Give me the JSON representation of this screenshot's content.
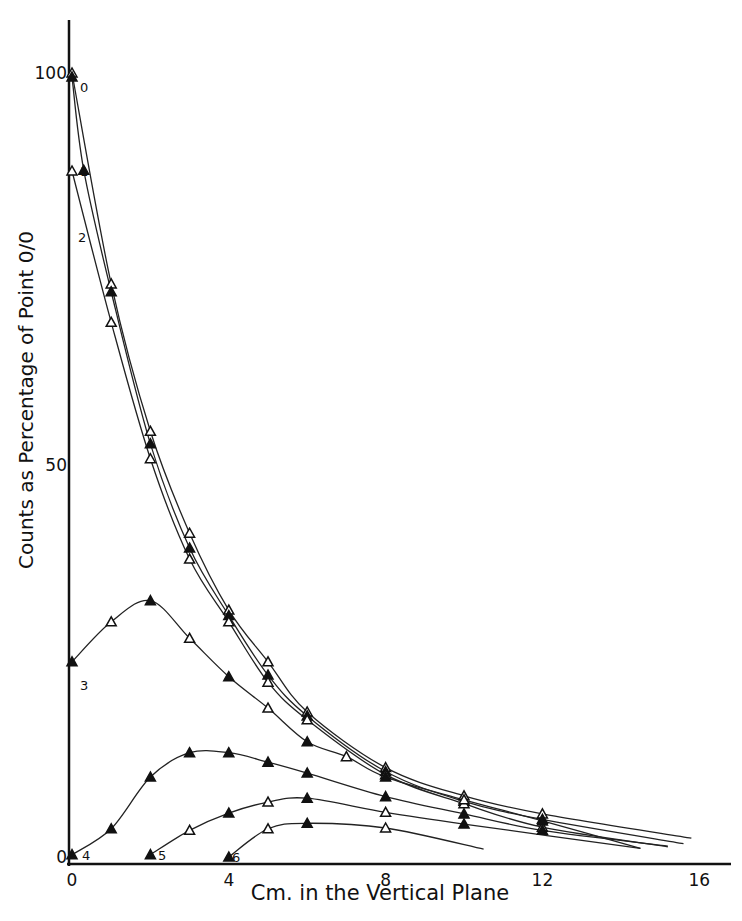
{
  "chart_data": {
    "type": "line",
    "title": "",
    "xlabel": "Cm. in the Vertical Plane",
    "ylabel": "Counts as Percentage of Point 0/0",
    "xlim": [
      0,
      17
    ],
    "ylim": [
      0,
      107
    ],
    "x_ticks": [
      0,
      4,
      8,
      12,
      16
    ],
    "x_tick_labels": [
      "0",
      "4",
      "8",
      "12",
      "16"
    ],
    "y_ticks": [
      0,
      50,
      100
    ],
    "y_tick_labels": [
      "0",
      "50",
      "100"
    ],
    "grid": false,
    "legend": "none (curves labeled inline 0-6)",
    "series": [
      {
        "name": "0",
        "marker": "open-triangle",
        "points": [
          [
            0,
            100
          ],
          [
            1,
            73.1
          ],
          [
            2,
            54.3
          ],
          [
            3,
            41.3
          ],
          [
            4,
            31.5
          ],
          [
            5,
            24.9
          ],
          [
            6,
            18.5
          ],
          [
            8,
            11.4
          ],
          [
            10,
            7.8
          ],
          [
            12,
            5.5
          ],
          [
            15.8,
            2.4
          ]
        ]
      },
      {
        "name": "1",
        "marker": "filled-triangle",
        "points": [
          [
            0,
            99.5
          ],
          [
            0.3,
            87.6
          ],
          [
            1,
            72.1
          ],
          [
            2,
            52.7
          ],
          [
            3,
            39.4
          ],
          [
            4,
            30.8
          ],
          [
            5,
            23.2
          ],
          [
            6,
            18.0
          ],
          [
            8,
            10.9
          ],
          [
            10,
            7.1
          ],
          [
            12,
            4.8
          ],
          [
            15.6,
            1.7
          ]
        ]
      },
      {
        "name": "2",
        "marker": "open-triangle",
        "points": [
          [
            0,
            87.5
          ],
          [
            1,
            68.2
          ],
          [
            2,
            50.8
          ],
          [
            3,
            38.0
          ],
          [
            4,
            30.0
          ],
          [
            5,
            22.3
          ],
          [
            6,
            17.5
          ],
          [
            8,
            10.5
          ],
          [
            10,
            6.8
          ],
          [
            12,
            3.8
          ],
          [
            15.2,
            1.3
          ]
        ]
      },
      {
        "name": "3",
        "marker": "triangle",
        "points": [
          [
            0,
            24.9
          ],
          [
            1,
            30.0
          ],
          [
            2,
            32.7
          ],
          [
            3,
            27.9
          ],
          [
            4,
            23.0
          ],
          [
            5,
            19.0
          ],
          [
            6,
            14.7
          ],
          [
            7,
            12.8
          ],
          [
            8,
            10.2
          ],
          [
            10,
            7.3
          ],
          [
            12,
            4.6
          ],
          [
            14.5,
            1.1
          ]
        ]
      },
      {
        "name": "4",
        "marker": "filled-triangle",
        "points": [
          [
            0,
            0.3
          ],
          [
            1,
            3.6
          ],
          [
            2,
            10.2
          ],
          [
            3,
            13.3
          ],
          [
            4,
            13.3
          ],
          [
            5,
            12.1
          ],
          [
            6,
            10.7
          ],
          [
            8,
            7.7
          ],
          [
            10,
            5.5
          ],
          [
            12,
            3.4
          ],
          [
            15.2,
            1.4
          ]
        ]
      },
      {
        "name": "5",
        "marker": "triangle",
        "points": [
          [
            2,
            0.3
          ],
          [
            3,
            3.4
          ],
          [
            4,
            5.6
          ],
          [
            5,
            7.0
          ],
          [
            6,
            7.5
          ],
          [
            8,
            5.7
          ],
          [
            10,
            4.2
          ],
          [
            14.5,
            1.1
          ]
        ]
      },
      {
        "name": "6",
        "marker": "triangle",
        "points": [
          [
            4,
            0
          ],
          [
            5,
            3.6
          ],
          [
            6,
            4.3
          ],
          [
            8,
            3.7
          ],
          [
            10.5,
            1.0
          ]
        ]
      }
    ]
  },
  "axes": {
    "xlabel": "Cm. in the Vertical Plane",
    "ylabel": "Counts as Percentage of Point 0/0",
    "x_tick_labels": [
      "0",
      "4",
      "8",
      "12",
      "16"
    ],
    "y_tick_labels": [
      "0",
      "50",
      "100"
    ]
  },
  "curve_labels": [
    "0",
    "1",
    "2",
    "3",
    "4",
    "5",
    "6"
  ]
}
